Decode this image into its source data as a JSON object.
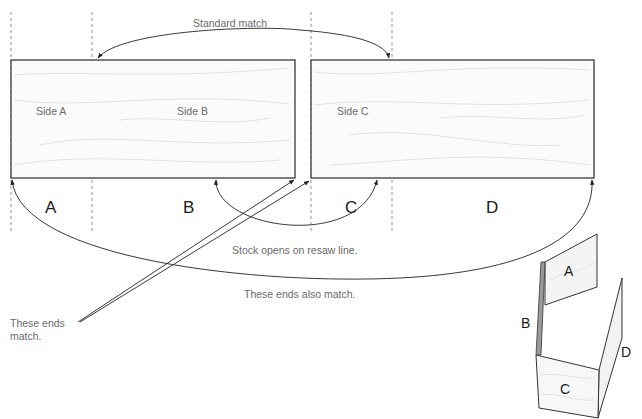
{
  "diagram": {
    "top_label": "Standard match",
    "boards": [
      {
        "id": "left",
        "side_labels": [
          "Side A",
          "Side B"
        ]
      },
      {
        "id": "right",
        "side_labels": [
          "Side C"
        ]
      }
    ],
    "segment_letters": [
      "A",
      "B",
      "C",
      "D"
    ],
    "notes": {
      "resaw": "Stock opens on resaw line.",
      "ends_also": "These ends also match.",
      "ends_match_line1": "These ends",
      "ends_match_line2": "match."
    },
    "box_labels": {
      "a": "A",
      "b": "B",
      "c": "C",
      "d": "D"
    },
    "colors": {
      "line": "#222222",
      "text_muted": "#6a6a6a",
      "board_fill": "#fbfbfb"
    }
  }
}
